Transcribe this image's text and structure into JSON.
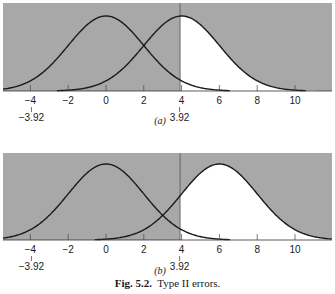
{
  "chart_data": [
    {
      "type": "area",
      "panel_label": "(a)",
      "title": "",
      "xlabel": "",
      "ylabel": "",
      "xlim": [
        -5.6,
        12
      ],
      "x_ticks": [
        -4,
        -2,
        0,
        2,
        4,
        6,
        8,
        10
      ],
      "x_tick_labels": [
        "−4",
        "−2",
        "0",
        "2",
        "4",
        "6",
        "8",
        "10"
      ],
      "annotations": [
        {
          "x": -3.92,
          "label": "−3.92"
        },
        {
          "x": 3.92,
          "label": "3.92"
        }
      ],
      "critical_value": 3.92,
      "series": [
        {
          "name": "H0 distribution",
          "distribution": "normal",
          "mean": 0,
          "sd": 2
        },
        {
          "name": "H1 distribution",
          "distribution": "normal",
          "mean": 4,
          "sd": 2
        }
      ],
      "shading": {
        "white_region": "area under H1 curve for x > 3.92",
        "gray_region": "background / remainder"
      },
      "grid": false
    },
    {
      "type": "area",
      "panel_label": "(b)",
      "title": "",
      "xlabel": "",
      "ylabel": "",
      "xlim": [
        -5.6,
        12
      ],
      "x_ticks": [
        -4,
        -2,
        0,
        2,
        4,
        6,
        8,
        10
      ],
      "x_tick_labels": [
        "−4",
        "−2",
        "0",
        "2",
        "4",
        "6",
        "8",
        "10"
      ],
      "annotations": [
        {
          "x": -3.92,
          "label": "−3.92"
        },
        {
          "x": 3.92,
          "label": "3.92"
        }
      ],
      "critical_value": 3.92,
      "series": [
        {
          "name": "H0 distribution",
          "distribution": "normal",
          "mean": 0,
          "sd": 2
        },
        {
          "name": "H1 distribution",
          "distribution": "normal",
          "mean": 6,
          "sd": 2
        }
      ],
      "shading": {
        "white_region": "area under H1 curve for x > 3.92",
        "gray_region": "background / remainder"
      },
      "grid": false
    }
  ],
  "caption": {
    "fig_number": "Fig. 5.2.",
    "text": "Type II errors."
  },
  "colors": {
    "background_gray": "#a8a8a8",
    "curve": "#1a1a1a",
    "highlight": "#ffffff"
  }
}
